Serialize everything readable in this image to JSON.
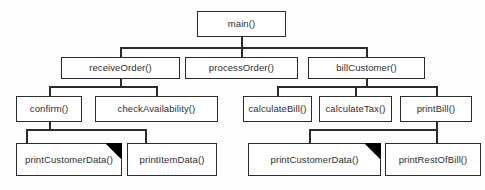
{
  "diagram": {
    "type": "structure-chart",
    "background_color": "#fdfdfd",
    "box_border_color": "#2b2b2b",
    "text_color": "#2e2e2e",
    "library_marker_color": "#000000",
    "legend_note": "Black triangle in top-right corner marks a pre-written / reused library module"
  },
  "nodes": {
    "main": {
      "label": "main()",
      "level": 0,
      "library": false
    },
    "receive_order": {
      "label": "receiveOrder()",
      "level": 1,
      "library": false
    },
    "process_order": {
      "label": "processOrder()",
      "level": 1,
      "library": false
    },
    "bill_customer": {
      "label": "billCustomer()",
      "level": 1,
      "library": false
    },
    "confirm": {
      "label": "confirm()",
      "level": 2,
      "library": false
    },
    "check_availability": {
      "label": "checkAvailability()",
      "level": 2,
      "library": false
    },
    "calculate_bill": {
      "label": "calculateBill()",
      "level": 2,
      "library": false
    },
    "calculate_tax": {
      "label": "calculateTax()",
      "level": 2,
      "library": false
    },
    "print_bill": {
      "label": "printBill()",
      "level": 2,
      "library": false
    },
    "print_customer_data_left": {
      "label": "printCustomerData()",
      "level": 3,
      "library": true
    },
    "print_item_data": {
      "label": "printItemData()",
      "level": 3,
      "library": false
    },
    "print_customer_data_right": {
      "label": "printCustomerData()",
      "level": 3,
      "library": true
    },
    "print_rest_of_bill": {
      "label": "printRestOfBill()",
      "level": 3,
      "library": false
    }
  },
  "edges": [
    {
      "from": "main",
      "to": "receive_order"
    },
    {
      "from": "main",
      "to": "process_order"
    },
    {
      "from": "main",
      "to": "bill_customer"
    },
    {
      "from": "receive_order",
      "to": "confirm"
    },
    {
      "from": "receive_order",
      "to": "check_availability"
    },
    {
      "from": "bill_customer",
      "to": "calculate_bill"
    },
    {
      "from": "bill_customer",
      "to": "calculate_tax"
    },
    {
      "from": "bill_customer",
      "to": "print_bill"
    },
    {
      "from": "confirm",
      "to": "print_customer_data_left"
    },
    {
      "from": "confirm",
      "to": "print_item_data"
    },
    {
      "from": "print_bill",
      "to": "print_customer_data_right"
    },
    {
      "from": "print_bill",
      "to": "print_rest_of_bill"
    }
  ]
}
